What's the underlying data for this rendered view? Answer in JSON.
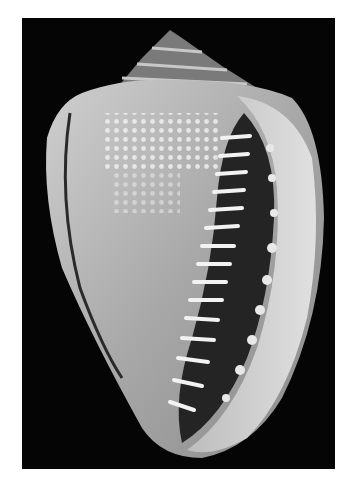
{
  "image": {
    "subject": "helmet seashell, aperture view",
    "style": "grayscale photograph",
    "colors": {
      "page_background": "#ffffff",
      "photo_background": "#050505",
      "shell_light": "#d8d8d8",
      "shell_mid": "#9a9a9a",
      "shell_dark": "#3a3a3a",
      "aperture": "#222222",
      "teeth": "#f2f2f2"
    }
  }
}
